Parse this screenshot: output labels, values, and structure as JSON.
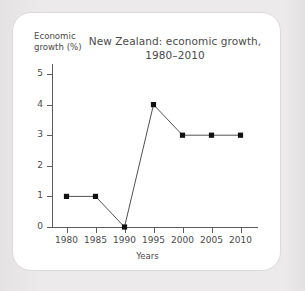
{
  "chart_data": {
    "type": "line",
    "title": "New Zealand: economic growth,",
    "title_line2": "1980–2010",
    "xlabel": "Years",
    "ylabel": "Economic",
    "ylabel_line2": "growth (%)",
    "categories": [
      "1980",
      "1985",
      "1990",
      "1995",
      "2000",
      "2005",
      "2010"
    ],
    "values": [
      1,
      1,
      0,
      4,
      3,
      3,
      3
    ],
    "x": [
      1980,
      1985,
      1990,
      1995,
      2000,
      2005,
      2010
    ],
    "ylim": [
      0,
      5
    ],
    "yticks": [
      0,
      1,
      2,
      3,
      4,
      5
    ],
    "ytick_labels": [
      "0",
      "1",
      "2",
      "3",
      "4",
      "5"
    ],
    "grid": false,
    "legend": false,
    "series": [
      {
        "name": "Economic growth (%)",
        "values": [
          1,
          1,
          0,
          4,
          3,
          3,
          3
        ],
        "line_color": "#3d3d3d",
        "marker": "square",
        "marker_color": "#111111"
      }
    ],
    "colors": {
      "axis": "#5d5d5d",
      "text": "#4a4a4a",
      "line": "#3d3d3d",
      "marker": "#111111",
      "card_background": "#ffffff",
      "card_border": "#dcdada",
      "page_background": "#eceaea"
    }
  }
}
